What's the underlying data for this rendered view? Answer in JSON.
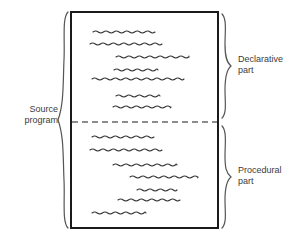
{
  "figure": {
    "background_color": "#ffffff",
    "ink_color": "#1a1a1a",
    "text_color": "#3b3b3b",
    "squiggle_color": "#333333"
  },
  "labels": {
    "source_program": "Source\nprogram",
    "declarative_part": "Declarative\npart",
    "procedural_part": "Procedural\npart"
  },
  "program_box": {
    "x": 71,
    "y": 12,
    "width": 147,
    "height": 216,
    "border_color": "#1a1a1a",
    "border_width": 2,
    "divider": {
      "y": 122,
      "style": "dashed",
      "color": "#1a1a1a"
    }
  },
  "braces": {
    "source_program": {
      "x": 64,
      "top": 12,
      "bottom": 228,
      "tip_y": 120,
      "direction": "right"
    },
    "declarative_part": {
      "x": 225,
      "top": 14,
      "bottom": 118,
      "tip_y": 66,
      "direction": "left"
    },
    "procedural_part": {
      "x": 225,
      "top": 126,
      "bottom": 228,
      "tip_y": 177,
      "direction": "left"
    }
  },
  "code_lines": {
    "declarative": [
      {
        "x": 93,
        "y": 32,
        "length": 62
      },
      {
        "x": 90,
        "y": 44,
        "length": 72
      },
      {
        "x": 116,
        "y": 57,
        "length": 73
      },
      {
        "x": 114,
        "y": 70,
        "length": 44
      },
      {
        "x": 92,
        "y": 79,
        "length": 92
      },
      {
        "x": 116,
        "y": 96,
        "length": 44
      },
      {
        "x": 113,
        "y": 107,
        "length": 58
      }
    ],
    "procedural": [
      {
        "x": 92,
        "y": 137,
        "length": 62
      },
      {
        "x": 90,
        "y": 150,
        "length": 72
      },
      {
        "x": 113,
        "y": 165,
        "length": 64
      },
      {
        "x": 130,
        "y": 177,
        "length": 68
      },
      {
        "x": 137,
        "y": 190,
        "length": 40
      },
      {
        "x": 118,
        "y": 200,
        "length": 62
      },
      {
        "x": 92,
        "y": 213,
        "length": 54
      }
    ]
  }
}
